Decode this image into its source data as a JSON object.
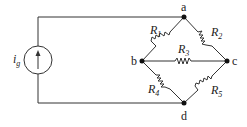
{
  "diagram": {
    "type": "circuit",
    "source": {
      "label": "i",
      "subscript": "g",
      "kind": "current-source",
      "direction": "up"
    },
    "nodes": [
      {
        "id": "a",
        "label": "a"
      },
      {
        "id": "b",
        "label": "b"
      },
      {
        "id": "c",
        "label": "c"
      },
      {
        "id": "d",
        "label": "d"
      }
    ],
    "resistors": [
      {
        "label": "R",
        "subscript": "1",
        "from": "a",
        "to": "b"
      },
      {
        "label": "R",
        "subscript": "2",
        "from": "a",
        "to": "c"
      },
      {
        "label": "R",
        "subscript": "3",
        "from": "b",
        "to": "c"
      },
      {
        "label": "R",
        "subscript": "4",
        "from": "b",
        "to": "d"
      },
      {
        "label": "R",
        "subscript": "5",
        "from": "c",
        "to": "d"
      }
    ],
    "colors": {
      "wire": "#333333",
      "node": "#111111",
      "text": "#222222"
    }
  }
}
